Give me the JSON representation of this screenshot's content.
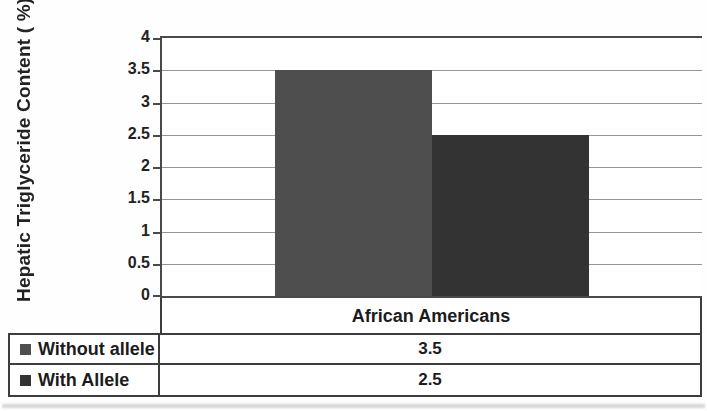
{
  "chart_data": {
    "type": "bar",
    "title": "",
    "categories": [
      "African Americans"
    ],
    "series": [
      {
        "name": "Without allele",
        "values": [
          3.5
        ],
        "color": "#4e4e4e"
      },
      {
        "name": "With Allele",
        "values": [
          2.5
        ],
        "color": "#333333"
      }
    ],
    "xlabel": "",
    "ylabel": "Hepatic Triglyceride Content ( %)",
    "ylim": [
      0,
      4
    ],
    "ytick_step": 0.5,
    "yticks": [
      "0",
      "0.5",
      "1",
      "1.5",
      "2",
      "2.5",
      "3",
      "3.5",
      "4"
    ],
    "grid": true,
    "legend_position": "table-bottom"
  },
  "table": {
    "category_header": "African Americans",
    "rows": [
      {
        "label": "Without allele",
        "value": "3.5",
        "marker_color": "#4e4e4e"
      },
      {
        "label": "With Allele",
        "value": "2.5",
        "marker_color": "#333333"
      }
    ]
  },
  "colors": {
    "axis": "#4a4a4a",
    "gridline": "#979797",
    "table_border": "#3d3d3d",
    "text": "#1c1c1c",
    "background": "#fefefe"
  }
}
